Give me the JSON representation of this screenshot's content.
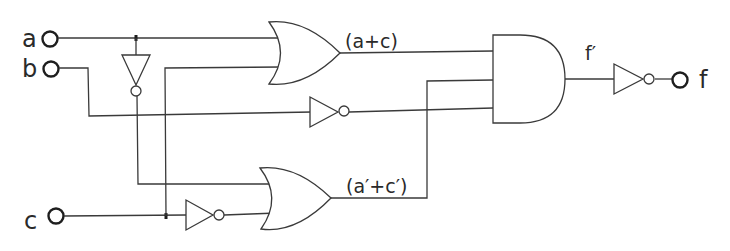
{
  "diagram": {
    "type": "logic-circuit",
    "inputs": [
      {
        "id": "a",
        "label": "a"
      },
      {
        "id": "b",
        "label": "b"
      },
      {
        "id": "c",
        "label": "c"
      }
    ],
    "output": {
      "id": "f",
      "label": "f"
    },
    "signal_labels": {
      "or_top_output": "(a+c)",
      "or_bottom_output": "(a′+c′)",
      "and_output": "f′"
    },
    "gates": [
      {
        "id": "not_a",
        "type": "NOT",
        "input": "a",
        "output": "a'"
      },
      {
        "id": "not_b",
        "type": "NOT",
        "input": "b",
        "output": "b'"
      },
      {
        "id": "not_c",
        "type": "NOT",
        "input": "c",
        "output": "c'"
      },
      {
        "id": "or_top",
        "type": "OR",
        "inputs": [
          "a",
          "c"
        ],
        "output": "(a+c)"
      },
      {
        "id": "or_bottom",
        "type": "OR",
        "inputs": [
          "a'",
          "c'"
        ],
        "output": "(a'+c')"
      },
      {
        "id": "and_main",
        "type": "AND",
        "inputs": [
          "(a+c)",
          "(a'+c')",
          "b'"
        ],
        "output": "f'"
      },
      {
        "id": "not_out",
        "type": "NOT",
        "input": "f'",
        "output": "f"
      }
    ],
    "colors": {
      "line": "#3a3a3a",
      "background": "#ffffff"
    }
  }
}
